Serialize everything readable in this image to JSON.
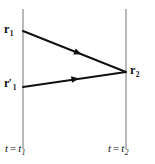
{
  "figure": {
    "type": "spacetime-propagator-diagram",
    "background_color": "#ffffff",
    "line_color_worldline": "#8a8a8a",
    "line_color_path": "#111111"
  },
  "worldlines": [
    {
      "id": "t1",
      "name": "left-worldline",
      "x": 23,
      "y_top": 9,
      "y_bottom": 149,
      "label": {
        "variable": "t",
        "equals": "=",
        "value_base": "t",
        "value_sub": "1"
      }
    },
    {
      "id": "t2",
      "name": "right-worldline",
      "x": 126,
      "y_top": 9,
      "y_bottom": 149,
      "label": {
        "variable": "t",
        "equals": "=",
        "value_base": "t",
        "value_sub": "2"
      }
    }
  ],
  "points": [
    {
      "id": "r1",
      "name": "upper-left-endpoint",
      "x": 23,
      "y": 31,
      "label_base": "r",
      "label_prime": "",
      "label_sub": "1"
    },
    {
      "id": "r1prime",
      "name": "lower-left-endpoint",
      "x": 23,
      "y": 87,
      "label_base": "r",
      "label_prime": "′",
      "label_sub": "1"
    },
    {
      "id": "r2",
      "name": "right-vertex",
      "x": 126,
      "y": 72,
      "label_base": "r",
      "label_prime": "",
      "label_sub": "2"
    }
  ],
  "paths": [
    {
      "id": "path-upper",
      "name": "upper-propagator-arrow",
      "from": "r1",
      "to": "r2",
      "x1": 23,
      "y1": 31,
      "x2": 126,
      "y2": 72,
      "arrow_position": 0.5,
      "direction": "rightward"
    },
    {
      "id": "path-lower",
      "name": "lower-propagator-arrow",
      "from": "r1prime",
      "to": "r2",
      "x1": 23,
      "y1": 87,
      "x2": 126,
      "y2": 72,
      "arrow_position": 0.5,
      "direction": "rightward"
    }
  ]
}
